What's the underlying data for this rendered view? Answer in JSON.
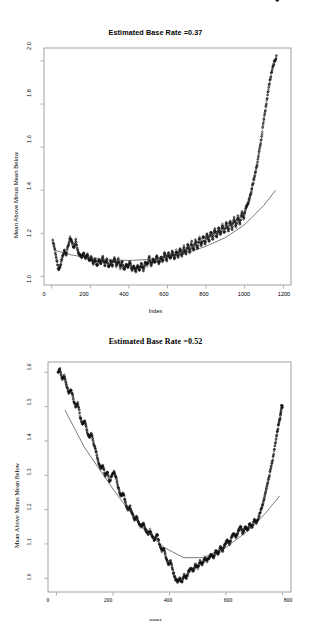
{
  "page": {
    "background": "#ffffff",
    "width": 311,
    "height": 627
  },
  "panels": [
    {
      "id": "panel-1",
      "title": "Estimated Base Rate =0.37",
      "xlabel": "Index",
      "ylabel": "Mean Above Minus Mean Below",
      "font": "sans",
      "xticks": [
        "0",
        "200",
        "400",
        "600",
        "800",
        "1000",
        "1200"
      ],
      "yticks": [
        "1.0",
        "1.2",
        "1.4",
        "1.6",
        "1.8",
        "2.0"
      ]
    },
    {
      "id": "panel-2",
      "title": "Estimated Base Rate =0.52",
      "xlabel": "Index",
      "ylabel": "Mean Above Minus Mean Below",
      "font": "serif",
      "xticks": [
        "0",
        "200",
        "400",
        "600",
        "800"
      ],
      "yticks": [
        "1.0",
        "1.1",
        "1.2",
        "1.3",
        "1.4",
        "1.5",
        "1.6"
      ]
    }
  ],
  "chart_data": [
    {
      "type": "scatter",
      "title": "Estimated Base Rate =0.37",
      "xlabel": "Index",
      "ylabel": "Mean Above Minus Mean Below",
      "xlim": [
        -40,
        1240
      ],
      "ylim": [
        0.96,
        2.06
      ],
      "xticks": [
        0,
        200,
        400,
        600,
        800,
        1000,
        1200
      ],
      "yticks": [
        1.0,
        1.2,
        1.4,
        1.6,
        1.8,
        2.0
      ],
      "grid": false,
      "legend": null,
      "point_marker": "open-circle",
      "series": [
        {
          "name": "Mean Above Minus Mean Below",
          "note": "dense oscillating point cloud, sawtooth ripple amplitude ~0.03-0.05 riding on a U-shaped trend",
          "x": [
            5,
            15,
            25,
            35,
            45,
            55,
            65,
            75,
            85,
            95,
            105,
            115,
            125,
            135,
            145,
            155,
            165,
            175,
            185,
            195,
            205,
            215,
            225,
            235,
            245,
            255,
            265,
            275,
            285,
            295,
            305,
            315,
            325,
            335,
            345,
            355,
            365,
            375,
            385,
            395,
            405,
            415,
            425,
            435,
            445,
            455,
            465,
            475,
            485,
            495,
            505,
            515,
            525,
            535,
            545,
            555,
            565,
            575,
            585,
            595,
            605,
            615,
            625,
            635,
            645,
            655,
            665,
            675,
            685,
            695,
            705,
            715,
            725,
            735,
            745,
            755,
            765,
            775,
            785,
            795,
            805,
            815,
            825,
            835,
            845,
            855,
            865,
            875,
            885,
            895,
            905,
            915,
            925,
            935,
            945,
            955,
            965,
            975,
            985,
            995,
            1005,
            1015,
            1025,
            1035,
            1045,
            1055,
            1065,
            1075,
            1085,
            1095,
            1105,
            1115,
            1125,
            1135,
            1145,
            1155,
            1165,
            1172
          ],
          "y": [
            1.17,
            1.13,
            1.08,
            1.03,
            1.05,
            1.09,
            1.12,
            1.1,
            1.14,
            1.18,
            1.16,
            1.13,
            1.17,
            1.12,
            1.1,
            1.09,
            1.11,
            1.08,
            1.1,
            1.07,
            1.09,
            1.06,
            1.08,
            1.05,
            1.08,
            1.06,
            1.09,
            1.05,
            1.08,
            1.04,
            1.07,
            1.05,
            1.09,
            1.05,
            1.08,
            1.04,
            1.07,
            1.03,
            1.06,
            1.04,
            1.07,
            1.03,
            1.05,
            1.02,
            1.05,
            1.03,
            1.06,
            1.03,
            1.07,
            1.05,
            1.09,
            1.05,
            1.08,
            1.06,
            1.1,
            1.06,
            1.09,
            1.07,
            1.11,
            1.07,
            1.11,
            1.08,
            1.12,
            1.08,
            1.12,
            1.09,
            1.13,
            1.09,
            1.14,
            1.1,
            1.15,
            1.11,
            1.16,
            1.12,
            1.17,
            1.13,
            1.18,
            1.14,
            1.19,
            1.15,
            1.2,
            1.16,
            1.21,
            1.17,
            1.22,
            1.18,
            1.23,
            1.19,
            1.24,
            1.2,
            1.25,
            1.21,
            1.26,
            1.22,
            1.27,
            1.23,
            1.28,
            1.24,
            1.3,
            1.27,
            1.32,
            1.33,
            1.36,
            1.4,
            1.44,
            1.48,
            1.52,
            1.58,
            1.63,
            1.7,
            1.76,
            1.82,
            1.88,
            1.93,
            1.97,
            2.0,
            2.02
          ]
        }
      ],
      "fit_curve": {
        "name": "fitted smooth curve",
        "style": "thin-solid-line",
        "x": [
          20,
          100,
          200,
          300,
          400,
          500,
          600,
          700,
          800,
          900,
          1000,
          1100,
          1160
        ],
        "y": [
          1.12,
          1.1,
          1.085,
          1.077,
          1.074,
          1.078,
          1.09,
          1.11,
          1.14,
          1.18,
          1.24,
          1.33,
          1.4
        ]
      }
    },
    {
      "type": "scatter",
      "title": "Estimated Base Rate =0.52",
      "xlabel": "Index",
      "ylabel": "Mean Above Minus Mean Below",
      "xlim": [
        -30,
        830
      ],
      "ylim": [
        0.96,
        1.63
      ],
      "xticks": [
        0,
        200,
        400,
        600,
        800
      ],
      "yticks": [
        1.0,
        1.1,
        1.2,
        1.3,
        1.4,
        1.5,
        1.6
      ],
      "grid": false,
      "legend": null,
      "point_marker": "open-circle",
      "series": [
        {
          "name": "Mean Above Minus Mean Below",
          "note": "descending then ascending U-shaped point cloud with ripples; sparse high outliers at right edge",
          "x": [
            5,
            12,
            20,
            28,
            36,
            44,
            52,
            60,
            68,
            76,
            84,
            92,
            100,
            108,
            116,
            124,
            132,
            140,
            148,
            156,
            164,
            172,
            180,
            188,
            196,
            204,
            212,
            220,
            228,
            236,
            244,
            252,
            260,
            268,
            276,
            284,
            292,
            300,
            308,
            316,
            324,
            332,
            340,
            348,
            356,
            364,
            372,
            380,
            388,
            396,
            404,
            412,
            420,
            428,
            436,
            444,
            452,
            460,
            468,
            476,
            484,
            492,
            500,
            508,
            516,
            524,
            532,
            540,
            548,
            556,
            564,
            572,
            580,
            588,
            596,
            604,
            612,
            620,
            628,
            636,
            644,
            652,
            660,
            668,
            676,
            684,
            692,
            700,
            708,
            716,
            724,
            732,
            740,
            748,
            756,
            764,
            772,
            780,
            786,
            792,
            796,
            800
          ],
          "y": [
            1.6,
            1.61,
            1.58,
            1.59,
            1.56,
            1.54,
            1.55,
            1.52,
            1.5,
            1.51,
            1.47,
            1.45,
            1.46,
            1.43,
            1.41,
            1.42,
            1.39,
            1.37,
            1.34,
            1.32,
            1.33,
            1.3,
            1.31,
            1.28,
            1.3,
            1.31,
            1.29,
            1.26,
            1.24,
            1.25,
            1.22,
            1.2,
            1.21,
            1.19,
            1.17,
            1.18,
            1.16,
            1.15,
            1.16,
            1.14,
            1.13,
            1.14,
            1.12,
            1.11,
            1.13,
            1.1,
            1.08,
            1.09,
            1.06,
            1.04,
            1.05,
            1.02,
            1.0,
            0.99,
            1.0,
            0.99,
            1.01,
            1.0,
            1.02,
            1.03,
            1.02,
            1.04,
            1.03,
            1.05,
            1.04,
            1.06,
            1.05,
            1.06,
            1.07,
            1.06,
            1.08,
            1.07,
            1.09,
            1.08,
            1.1,
            1.11,
            1.1,
            1.12,
            1.13,
            1.12,
            1.14,
            1.15,
            1.13,
            1.15,
            1.14,
            1.16,
            1.15,
            1.17,
            1.16,
            1.18,
            1.2,
            1.22,
            1.25,
            1.28,
            1.31,
            1.34,
            1.38,
            1.42,
            1.45,
            1.47,
            1.5,
            1.5
          ]
        }
      ],
      "fit_curve": {
        "name": "fitted smooth curve",
        "style": "thin-solid-line",
        "x": [
          30,
          100,
          200,
          300,
          380,
          450,
          520,
          600,
          680,
          740,
          790
        ],
        "y": [
          1.49,
          1.38,
          1.26,
          1.15,
          1.09,
          1.06,
          1.06,
          1.09,
          1.14,
          1.19,
          1.24
        ]
      }
    }
  ]
}
